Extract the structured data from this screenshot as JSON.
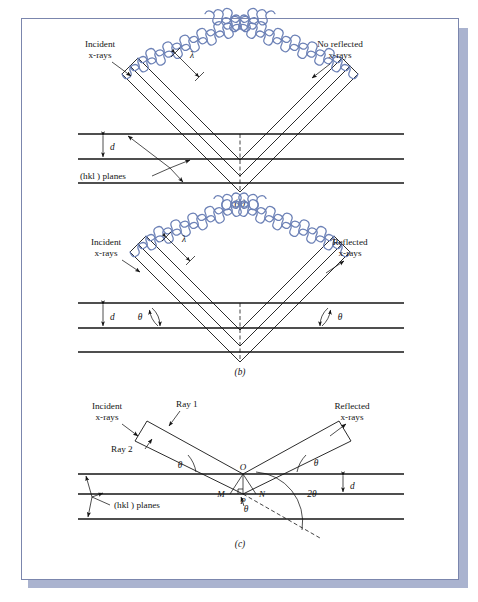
{
  "figure": {
    "wave_color": "#6c81b6",
    "line_color": "#141414",
    "sheet_border_color": "#7b86ad",
    "shadow_color": "#aab3cf",
    "background_color": "#ffffff"
  },
  "panels": [
    {
      "id": "a",
      "caption": "(a)",
      "labels": {
        "incident": "Incident\nx-rays",
        "incident_line1": "Incident",
        "incident_line2": "x-rays",
        "outgoing_line1": "No  reflected",
        "outgoing_line2": "x-rays",
        "wavelength": "λ",
        "spacing": "d",
        "planes": "(hkl ) planes"
      },
      "geometry": {
        "plane_y": [
          134,
          159,
          183
        ],
        "vertex_x": 240,
        "ray_count": 3,
        "phase": "out-of-phase (destructive interference)"
      }
    },
    {
      "id": "b",
      "caption": "(b)",
      "labels": {
        "incident_line1": "Incident",
        "incident_line2": "x-rays",
        "outgoing_line1": "Reflected",
        "outgoing_line2": "x-rays",
        "wavelength": "λ",
        "spacing": "d",
        "angle_left": "θ",
        "angle_right": "θ"
      },
      "geometry": {
        "plane_y": [
          303,
          328,
          352
        ],
        "vertex_x": 240,
        "ray_count": 3,
        "phase": "in-phase (constructive interference)"
      }
    },
    {
      "id": "c",
      "caption": "(c)",
      "labels": {
        "incident_line1": "Incident",
        "incident_line2": "x-rays",
        "outgoing_line1": "Reflected",
        "outgoing_line2": "x-rays",
        "ray1": "Ray 1",
        "ray2": "Ray 2",
        "spacing": "d",
        "planes": "(hkl ) planes",
        "angle_left": "θ",
        "angle_right": "θ",
        "angle_below": "θ",
        "angle_two_theta": "2θ",
        "point_O": "O",
        "point_M": "M",
        "point_N": "N",
        "point_P": "P"
      },
      "geometry": {
        "plane_y": [
          474,
          494,
          519
        ],
        "vertex_x": 243,
        "theta_degrees": 30
      }
    }
  ]
}
